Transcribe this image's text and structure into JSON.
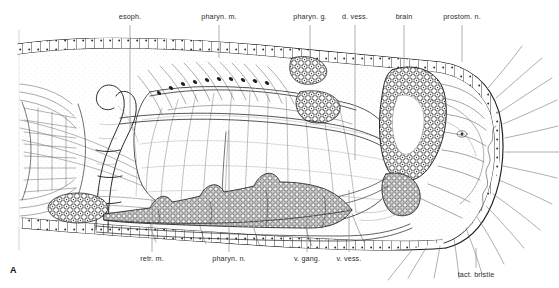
{
  "figure": {
    "panel_letter": "A",
    "background_color": "#ffffff",
    "ink_color": "#2b2b2b",
    "leader_color": "#8d8d8d"
  },
  "labels": {
    "top": [
      {
        "id": "esoph",
        "text": "esoph.",
        "x": 130,
        "y": 16,
        "leader_x": 130,
        "leader_y1": 25,
        "leader_y2": 130
      },
      {
        "id": "pharyn-m",
        "text": "pharyn. m.",
        "x": 219,
        "y": 16,
        "leader_x": 219,
        "leader_y1": 25,
        "leader_y2": 58
      },
      {
        "id": "pharyn-g",
        "text": "pharyn. g.",
        "x": 310,
        "y": 16,
        "leader_x": 310,
        "leader_y1": 25,
        "leader_y2": 64
      },
      {
        "id": "d-vess",
        "text": "d. vess.",
        "x": 355,
        "y": 16,
        "leader_x": 355,
        "leader_y1": 25,
        "leader_y2": 160
      },
      {
        "id": "brain",
        "text": "brain",
        "x": 404,
        "y": 16,
        "leader_x": 404,
        "leader_y1": 25,
        "leader_y2": 68
      },
      {
        "id": "prostom-n",
        "text": "prostom. n.",
        "x": 462,
        "y": 16,
        "leader_x": 462,
        "leader_y1": 25,
        "leader_y2": 62
      }
    ],
    "bottom": [
      {
        "id": "retr-m",
        "text": "retr. m.",
        "x": 152,
        "y": 258,
        "leader_x": 152,
        "leader_y1": 200,
        "leader_y2": 252
      },
      {
        "id": "pharyn-n",
        "text": "pharyn. n.",
        "x": 229,
        "y": 258,
        "leader_x": 229,
        "leader_y1": 130,
        "leader_y2": 252
      },
      {
        "id": "v-gang",
        "text": "v. gang.",
        "x": 307,
        "y": 258,
        "leader_x": 307,
        "leader_y1": 215,
        "leader_y2": 252
      },
      {
        "id": "v-vess",
        "text": "v. vess.",
        "x": 349,
        "y": 258,
        "leader_x": 349,
        "leader_y1": 190,
        "leader_y2": 252
      },
      {
        "id": "tact-brist",
        "text": "tact. bristle",
        "x": 476,
        "y": 274,
        "leader_x": 476,
        "leader_y1": 248,
        "leader_y2": 268
      }
    ]
  }
}
